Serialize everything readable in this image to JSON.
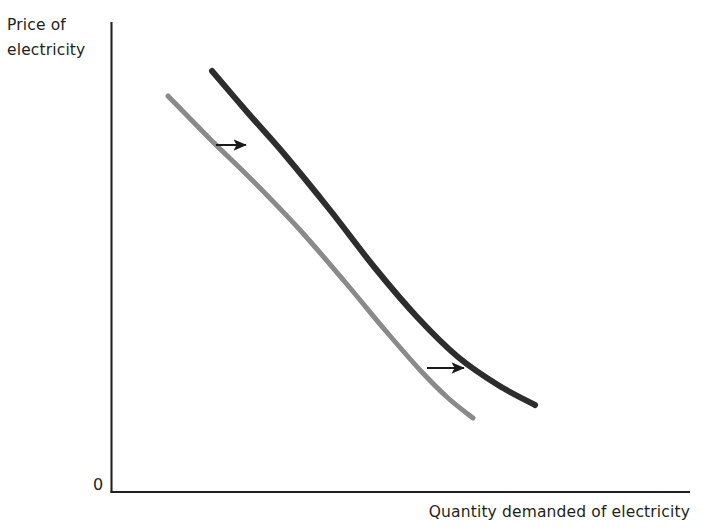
{
  "figure": {
    "width": 701,
    "height": 532,
    "background": "#ffffff"
  },
  "labels": {
    "y_axis_line1": "Price of",
    "y_axis_line2": "electricity",
    "x_axis": "Quantity demanded of electricity",
    "origin": "0"
  },
  "colors": {
    "axis": "#231f20",
    "text": "#231f20",
    "curve_original": "#8a8a8a",
    "curve_shifted": "#2d2d2d",
    "arrow": "#1a1a1a",
    "background": "#ffffff"
  },
  "chart_data": {
    "type": "line",
    "title": "",
    "xlabel": "Quantity demanded of electricity",
    "ylabel": "Price of electricity",
    "grid": false,
    "legend_position": "none",
    "axis_ticks": {
      "x": [],
      "y": [],
      "origin_label": "0"
    },
    "axes": {
      "y_axis_x_px": 111,
      "y_axis_top_px": 22,
      "y_axis_bottom_px": 492,
      "x_axis_y_px": 492,
      "x_axis_left_px": 111,
      "x_axis_right_px": 690
    },
    "annotation": "A rightward shift of the demand curve for electricity: at every price, a larger quantity is demanded.",
    "series": [
      {
        "name": "Original demand curve",
        "role": "original",
        "color": "#8a8a8a",
        "stroke_width": 5,
        "style": "solid",
        "points_px": [
          [
            168,
            96
          ],
          [
            210,
            139
          ],
          [
            253,
            181
          ],
          [
            300,
            230
          ],
          [
            345,
            282
          ],
          [
            385,
            330
          ],
          [
            420,
            370
          ],
          [
            448,
            398
          ],
          [
            473,
            418
          ]
        ]
      },
      {
        "name": "New demand curve (shifted right)",
        "role": "shifted",
        "color": "#2d2d2d",
        "stroke_width": 6,
        "style": "solid",
        "points_px": [
          [
            212,
            71
          ],
          [
            248,
            113
          ],
          [
            285,
            155
          ],
          [
            330,
            210
          ],
          [
            375,
            268
          ],
          [
            418,
            318
          ],
          [
            458,
            357
          ],
          [
            498,
            385
          ],
          [
            535,
            405
          ]
        ]
      }
    ],
    "arrows": [
      {
        "name": "upper-shift-arrow",
        "direction": "right",
        "x1_px": 216,
        "y1_px": 145,
        "x2_px": 252,
        "y2_px": 145,
        "color": "#1a1a1a"
      },
      {
        "name": "lower-shift-arrow",
        "direction": "right",
        "x1_px": 427,
        "y1_px": 368,
        "x2_px": 470,
        "y2_px": 368,
        "color": "#1a1a1a"
      }
    ]
  }
}
